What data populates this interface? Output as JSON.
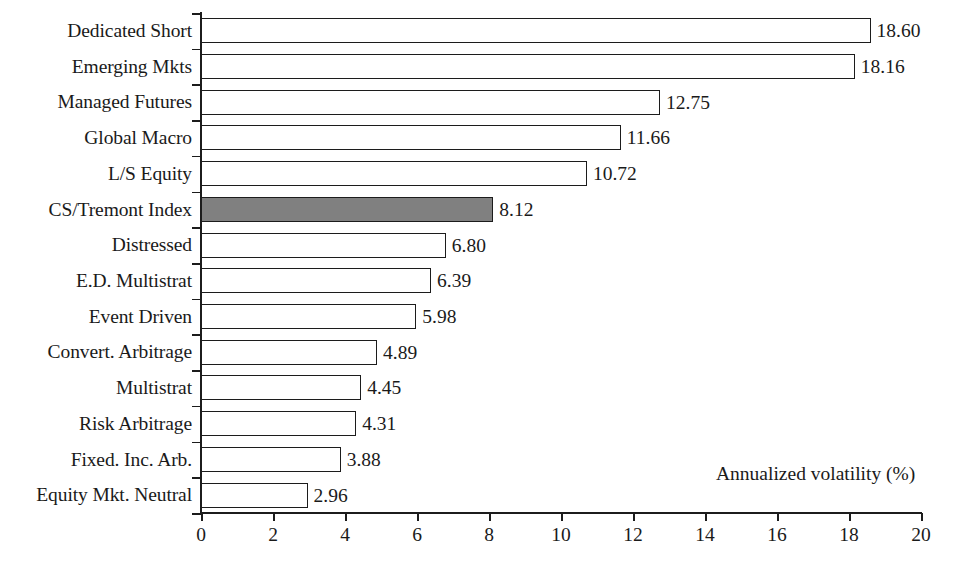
{
  "chart_data": {
    "type": "bar",
    "orientation": "horizontal",
    "title": "",
    "subtitle": "",
    "xlabel": "Annualized volatility (%)",
    "ylabel": "",
    "xlim": [
      0,
      20
    ],
    "xticks": [
      0,
      2,
      4,
      6,
      8,
      10,
      12,
      14,
      16,
      18,
      20
    ],
    "xtick_labels": [
      "0",
      "2",
      "4",
      "6",
      "8",
      "10",
      "12",
      "14",
      "16",
      "18",
      "20"
    ],
    "grid": false,
    "legend": null,
    "categories": [
      "Dedicated Short",
      "Emerging Mkts",
      "Managed Futures",
      "Global Macro",
      "L/S Equity",
      "CS/Tremont Index",
      "Distressed",
      "E.D. Multistrat",
      "Event Driven",
      "Convert. Arbitrage",
      "Multistrat",
      "Risk Arbitrage",
      "Fixed. Inc. Arb.",
      "Equity Mkt. Neutral"
    ],
    "values": [
      18.6,
      18.16,
      12.75,
      11.66,
      10.72,
      8.12,
      6.8,
      6.39,
      5.98,
      4.89,
      4.45,
      4.31,
      3.88,
      2.96
    ],
    "value_labels": [
      "18.60",
      "18.16",
      "12.75",
      "11.66",
      "10.72",
      "8.12",
      "6.80",
      "6.39",
      "5.98",
      "4.89",
      "4.45",
      "4.31",
      "3.88",
      "2.96"
    ],
    "highlighted_category": "CS/Tremont Index",
    "highlighted_index": 5,
    "colors": {
      "bar_fill": "#ffffff",
      "bar_highlight_fill": "#808080",
      "bar_edge": "#1c1c1c",
      "axis": "#1c1c1c",
      "text": "#1a1a1a",
      "background": "#ffffff"
    }
  }
}
